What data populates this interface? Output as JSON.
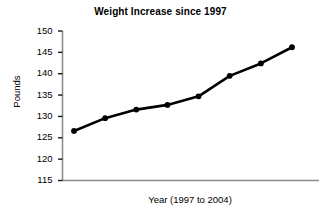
{
  "chart_data": {
    "type": "line",
    "title": "Weight Increase since 1997",
    "xlabel": "Year (1997 to 2004)",
    "ylabel": "Pounds",
    "categories": [
      "1997",
      "1998",
      "1999",
      "2000",
      "2001",
      "2002",
      "2003",
      "2004"
    ],
    "values": [
      126.6,
      129.6,
      131.6,
      132.7,
      134.7,
      139.5,
      142.4,
      146.2
    ],
    "ylim": [
      115,
      150
    ],
    "ytick_labels": [
      "150",
      "145",
      "140",
      "135",
      "130",
      "125",
      "120",
      "115"
    ],
    "ytick_values": [
      150,
      145,
      140,
      135,
      130,
      125,
      120,
      115
    ],
    "xtick_labels": [],
    "grid": false,
    "legend": false,
    "legend_position": "none",
    "series_color": "#000000",
    "axis_color": "#808080",
    "marker": "circle",
    "background_color": "#ffffff"
  }
}
